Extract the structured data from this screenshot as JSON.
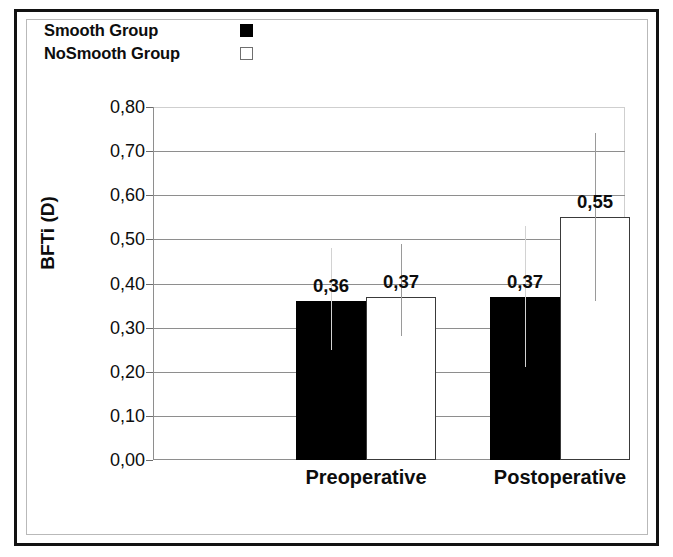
{
  "figure": {
    "legend": {
      "entries": [
        {
          "label": "Smooth Group",
          "marker": "filled-square",
          "color": "#000000"
        },
        {
          "label": "NoSmooth Group",
          "marker": "hollow-square",
          "color": "#ffffff"
        }
      ]
    },
    "axis": {
      "y_title": "BFTi (D)",
      "y_ticks": [
        "0,80",
        "0,70",
        "0,60",
        "0,50",
        "0,40",
        "0,30",
        "0,20",
        "0,10",
        "0,00"
      ]
    }
  },
  "chart_data": {
    "type": "bar",
    "title": "",
    "xlabel": "",
    "ylabel": "BFTi (D)",
    "ylim": [
      0.0,
      0.8
    ],
    "ytick_step": 0.1,
    "grid": true,
    "legend_position": "top-left",
    "decimal_separator": ",",
    "categories": [
      "Preoperative",
      "Postoperative"
    ],
    "series": [
      {
        "name": "Smooth Group",
        "color": "#000000",
        "values": [
          0.36,
          0.37
        ],
        "labels": [
          "0,36",
          "0,37"
        ],
        "error_low": [
          0.25,
          0.21
        ],
        "error_high": [
          0.48,
          0.53
        ]
      },
      {
        "name": "NoSmooth Group",
        "color": "#ffffff",
        "values": [
          0.37,
          0.55
        ],
        "labels": [
          "0,37",
          "0,55"
        ],
        "error_low": [
          0.28,
          0.36
        ],
        "error_high": [
          0.49,
          0.74
        ]
      }
    ]
  }
}
